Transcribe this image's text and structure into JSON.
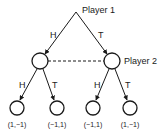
{
  "diagram": {
    "type": "extensive-form game tree",
    "colors": {
      "stroke": "#1a1a1a",
      "background": "#ffffff"
    },
    "players": {
      "p1": "Player 1",
      "p2": "Player 2"
    },
    "root": {
      "player": "Player 1"
    },
    "level1": {
      "left_action": "H",
      "right_action": "T",
      "information_set": "Player 2 (dashed line joins both nodes)"
    },
    "level2": {
      "left_node": {
        "left_action": "H",
        "right_action": "T"
      },
      "right_node": {
        "left_action": "H",
        "right_action": "T"
      }
    },
    "payoffs": [
      "(1,−1)",
      "(−1,1)",
      "(−1,1)",
      "(1,−1)"
    ]
  }
}
